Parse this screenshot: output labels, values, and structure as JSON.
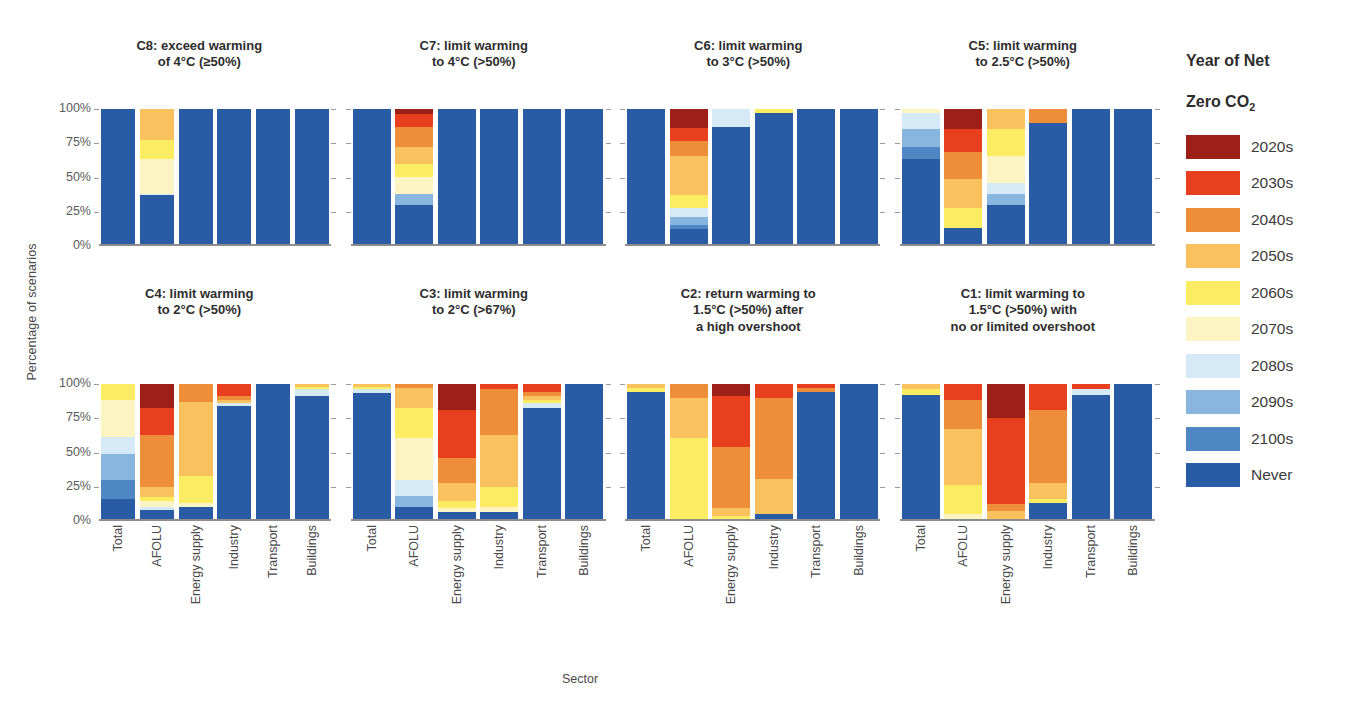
{
  "figure": {
    "ylabel": "Percentage of scenarios",
    "xlabel": "Sector"
  },
  "legend": {
    "title_line1": "Year of Net",
    "title_line2_pre": "Zero CO",
    "title_line2_sub": "2",
    "position": "right",
    "items": [
      {
        "label": "2020s",
        "color": "#9c1f18"
      },
      {
        "label": "2030s",
        "color": "#e8401f"
      },
      {
        "label": "2040s",
        "color": "#ef8e38"
      },
      {
        "label": "2050s",
        "color": "#fac25f"
      },
      {
        "label": "2060s",
        "color": "#fcec62"
      },
      {
        "label": "2070s",
        "color": "#fdf4c4"
      },
      {
        "label": "2080s",
        "color": "#d5eaf6"
      },
      {
        "label": "2090s",
        "color": "#89b6de"
      },
      {
        "label": "2100s",
        "color": "#4f87c4"
      },
      {
        "label": "Never",
        "color": "#2a5ca5"
      }
    ]
  },
  "axes": {
    "yticks": [
      "100%",
      "75%",
      "50%",
      "25%",
      "0%"
    ],
    "ytick_values": [
      100,
      75,
      50,
      25,
      0
    ],
    "ylim": [
      0,
      100
    ],
    "categories": [
      "Total",
      "AFOLU",
      "Energy supply",
      "Industry",
      "Transport",
      "Buildings"
    ]
  },
  "chart_data": {
    "type": "bar",
    "subtype": "stacked-percentage",
    "xlabel": "Sector",
    "ylabel": "Percentage of scenarios",
    "ylim": [
      0,
      100
    ],
    "grid": true,
    "legend_position": "right",
    "categories": [
      "Total",
      "AFOLU",
      "Energy supply",
      "Industry",
      "Transport",
      "Buildings"
    ],
    "series_order": [
      "2020s",
      "2030s",
      "2040s",
      "2050s",
      "2060s",
      "2070s",
      "2080s",
      "2090s",
      "2100s",
      "Never"
    ],
    "panels": [
      {
        "id": "C8",
        "title": "C8: exceed warming\nof 4°C (≥50%)",
        "row": 0,
        "bars": {
          "Total": {
            "2020s": 0,
            "2030s": 0,
            "2040s": 0,
            "2050s": 0,
            "2060s": 0,
            "2070s": 0,
            "2080s": 0,
            "2090s": 0,
            "2100s": 0,
            "Never": 100
          },
          "AFOLU": {
            "2020s": 0,
            "2030s": 0,
            "2040s": 0,
            "2050s": 23,
            "2060s": 14,
            "2070s": 26,
            "2080s": 1,
            "2090s": 0,
            "2100s": 0,
            "Never": 36
          },
          "Energy supply": {
            "2020s": 0,
            "2030s": 0,
            "2040s": 0,
            "2050s": 0,
            "2060s": 0,
            "2070s": 0,
            "2080s": 0,
            "2090s": 0,
            "2100s": 0,
            "Never": 100
          },
          "Industry": {
            "2020s": 0,
            "2030s": 0,
            "2040s": 0,
            "2050s": 0,
            "2060s": 0,
            "2070s": 0,
            "2080s": 0,
            "2090s": 0,
            "2100s": 0,
            "Never": 100
          },
          "Transport": {
            "2020s": 0,
            "2030s": 0,
            "2040s": 0,
            "2050s": 0,
            "2060s": 0,
            "2070s": 0,
            "2080s": 0,
            "2090s": 0,
            "2100s": 0,
            "Never": 100
          },
          "Buildings": {
            "2020s": 0,
            "2030s": 0,
            "2040s": 0,
            "2050s": 0,
            "2060s": 0,
            "2070s": 0,
            "2080s": 0,
            "2090s": 0,
            "2100s": 0,
            "Never": 100
          }
        }
      },
      {
        "id": "C7",
        "title": "C7: limit warming\nto 4°C (>50%)",
        "row": 0,
        "bars": {
          "Total": {
            "2020s": 0,
            "2030s": 0,
            "2040s": 0,
            "2050s": 0,
            "2060s": 0,
            "2070s": 0,
            "2080s": 0,
            "2090s": 0,
            "2100s": 0,
            "Never": 100
          },
          "AFOLU": {
            "2020s": 4,
            "2030s": 9,
            "2040s": 15,
            "2050s": 13,
            "2060s": 9,
            "2070s": 13,
            "2080s": 0,
            "2090s": 8,
            "2100s": 0,
            "Never": 29
          },
          "Energy supply": {
            "2020s": 0,
            "2030s": 0,
            "2040s": 0,
            "2050s": 0,
            "2060s": 0,
            "2070s": 0,
            "2080s": 0,
            "2090s": 0,
            "2100s": 0,
            "Never": 100
          },
          "Industry": {
            "2020s": 0,
            "2030s": 0,
            "2040s": 0,
            "2050s": 0,
            "2060s": 0,
            "2070s": 0,
            "2080s": 0,
            "2090s": 0,
            "2100s": 0,
            "Never": 100
          },
          "Transport": {
            "2020s": 0,
            "2030s": 0,
            "2040s": 0,
            "2050s": 0,
            "2060s": 0,
            "2070s": 0,
            "2080s": 0,
            "2090s": 0,
            "2100s": 0,
            "Never": 100
          },
          "Buildings": {
            "2020s": 0,
            "2030s": 0,
            "2040s": 0,
            "2050s": 0,
            "2060s": 0,
            "2070s": 0,
            "2080s": 0,
            "2090s": 0,
            "2100s": 0,
            "Never": 100
          }
        }
      },
      {
        "id": "C6",
        "title": "C6: limit warming\nto 3°C (>50%)",
        "row": 0,
        "bars": {
          "Total": {
            "2020s": 0,
            "2030s": 0,
            "2040s": 0,
            "2050s": 0,
            "2060s": 0,
            "2070s": 0,
            "2080s": 0,
            "2090s": 0,
            "2100s": 0,
            "Never": 100
          },
          "AFOLU": {
            "2020s": 14,
            "2030s": 10,
            "2040s": 11,
            "2050s": 29,
            "2060s": 9,
            "2070s": 0,
            "2080s": 7,
            "2090s": 6,
            "2100s": 3,
            "Never": 11
          },
          "Energy supply": {
            "2020s": 0,
            "2030s": 0,
            "2040s": 0,
            "2050s": 0,
            "2060s": 0,
            "2070s": 0,
            "2080s": 13,
            "2090s": 0,
            "2100s": 0,
            "Never": 87
          },
          "Industry": {
            "2020s": 0,
            "2030s": 0,
            "2040s": 0,
            "2050s": 0,
            "2060s": 3,
            "2070s": 0,
            "2080s": 0,
            "2090s": 0,
            "2100s": 0,
            "Never": 97
          },
          "Transport": {
            "2020s": 0,
            "2030s": 0,
            "2040s": 0,
            "2050s": 0,
            "2060s": 0,
            "2070s": 0,
            "2080s": 0,
            "2090s": 0,
            "2100s": 0,
            "Never": 100
          },
          "Buildings": {
            "2020s": 0,
            "2030s": 0,
            "2040s": 0,
            "2050s": 0,
            "2060s": 0,
            "2070s": 0,
            "2080s": 0,
            "2090s": 0,
            "2100s": 0,
            "Never": 100
          }
        }
      },
      {
        "id": "C5",
        "title": "C5: limit warming\nto 2.5°C (>50%)",
        "row": 0,
        "bars": {
          "Total": {
            "2020s": 0,
            "2030s": 0,
            "2040s": 0,
            "2050s": 0,
            "2060s": 0,
            "2070s": 3,
            "2080s": 12,
            "2090s": 13,
            "2100s": 9,
            "Never": 63
          },
          "AFOLU": {
            "2020s": 15,
            "2030s": 17,
            "2040s": 20,
            "2050s": 21,
            "2060s": 15,
            "2070s": 0,
            "2080s": 0,
            "2090s": 0,
            "2100s": 0,
            "Never": 12
          },
          "Energy supply": {
            "2020s": 0,
            "2030s": 0,
            "2040s": 0,
            "2050s": 15,
            "2060s": 20,
            "2070s": 20,
            "2080s": 8,
            "2090s": 8,
            "2100s": 0,
            "Never": 29
          },
          "Industry": {
            "2020s": 0,
            "2030s": 0,
            "2040s": 10,
            "2050s": 0,
            "2060s": 0,
            "2070s": 0,
            "2080s": 0,
            "2090s": 0,
            "2100s": 0,
            "Never": 90
          },
          "Transport": {
            "2020s": 0,
            "2030s": 0,
            "2040s": 0,
            "2050s": 0,
            "2060s": 0,
            "2070s": 0,
            "2080s": 0,
            "2090s": 0,
            "2100s": 0,
            "Never": 100
          },
          "Buildings": {
            "2020s": 0,
            "2030s": 0,
            "2040s": 0,
            "2050s": 0,
            "2060s": 0,
            "2070s": 0,
            "2080s": 0,
            "2090s": 0,
            "2100s": 0,
            "Never": 100
          }
        }
      },
      {
        "id": "C4",
        "title": "C4: limit warming\nto 2°C (>50%)",
        "row": 1,
        "bars": {
          "Total": {
            "2020s": 0,
            "2030s": 0,
            "2040s": 0,
            "2050s": 0,
            "2060s": 12,
            "2070s": 27,
            "2080s": 13,
            "2090s": 19,
            "2100s": 14,
            "Never": 15
          },
          "AFOLU": {
            "2020s": 18,
            "2030s": 20,
            "2040s": 38,
            "2050s": 8,
            "2060s": 3,
            "2070s": 4,
            "2080s": 2,
            "2090s": 0,
            "2100s": 0,
            "Never": 7
          },
          "Energy supply": {
            "2020s": 0,
            "2030s": 0,
            "2040s": 13,
            "2050s": 55,
            "2060s": 20,
            "2070s": 3,
            "2080s": 0,
            "2090s": 0,
            "2100s": 0,
            "Never": 9
          },
          "Industry": {
            "2020s": 0,
            "2030s": 9,
            "2040s": 3,
            "2050s": 2,
            "2060s": 0,
            "2070s": 0,
            "2080s": 2,
            "2090s": 0,
            "2100s": 0,
            "Never": 84
          },
          "Transport": {
            "2020s": 0,
            "2030s": 0,
            "2040s": 0,
            "2050s": 0,
            "2060s": 0,
            "2070s": 0,
            "2080s": 0,
            "2090s": 0,
            "2100s": 0,
            "Never": 100
          },
          "Buildings": {
            "2020s": 0,
            "2030s": 0,
            "2040s": 0,
            "2050s": 2,
            "2060s": 2,
            "2070s": 0,
            "2080s": 5,
            "2090s": 0,
            "2100s": 0,
            "Never": 91
          }
        }
      },
      {
        "id": "C3",
        "title": "C3: limit warming\nto 2°C (>67%)",
        "row": 1,
        "bars": {
          "Total": {
            "2020s": 0,
            "2030s": 0,
            "2040s": 0,
            "2050s": 2,
            "2060s": 2,
            "2070s": 0,
            "2080s": 3,
            "2090s": 0,
            "2100s": 0,
            "Never": 93
          },
          "AFOLU": {
            "2020s": 0,
            "2030s": 0,
            "2040s": 3,
            "2050s": 15,
            "2060s": 22,
            "2070s": 31,
            "2080s": 12,
            "2090s": 8,
            "2100s": 0,
            "Never": 9
          },
          "Energy supply": {
            "2020s": 19,
            "2030s": 36,
            "2040s": 18,
            "2050s": 14,
            "2060s": 5,
            "2070s": 3,
            "2080s": 0,
            "2090s": 0,
            "2100s": 0,
            "Never": 5
          },
          "Industry": {
            "2020s": 0,
            "2030s": 4,
            "2040s": 34,
            "2050s": 38,
            "2060s": 15,
            "2070s": 4,
            "2080s": 0,
            "2090s": 0,
            "2100s": 0,
            "Never": 5
          },
          "Transport": {
            "2020s": 0,
            "2030s": 6,
            "2040s": 3,
            "2050s": 3,
            "2060s": 2,
            "2070s": 0,
            "2080s": 4,
            "2090s": 0,
            "2100s": 0,
            "Never": 82
          },
          "Buildings": {
            "2020s": 0,
            "2030s": 0,
            "2040s": 0,
            "2050s": 0,
            "2060s": 0,
            "2070s": 0,
            "2080s": 0,
            "2090s": 0,
            "2100s": 0,
            "Never": 100
          }
        }
      },
      {
        "id": "C2",
        "title": "C2: return warming to\n1.5°C (>50%) after\na high overshoot",
        "row": 1,
        "bars": {
          "Total": {
            "2020s": 0,
            "2030s": 0,
            "2040s": 0,
            "2050s": 3,
            "2060s": 3,
            "2070s": 0,
            "2080s": 0,
            "2090s": 0,
            "2100s": 0,
            "Never": 94
          },
          "AFOLU": {
            "2020s": 0,
            "2030s": 0,
            "2040s": 10,
            "2050s": 30,
            "2060s": 60,
            "2070s": 0,
            "2080s": 0,
            "2090s": 0,
            "2100s": 0,
            "Never": 0
          },
          "Energy supply": {
            "2020s": 9,
            "2030s": 38,
            "2040s": 45,
            "2050s": 6,
            "2060s": 2,
            "2070s": 0,
            "2080s": 0,
            "2090s": 0,
            "2100s": 0,
            "Never": 0
          },
          "Industry": {
            "2020s": 0,
            "2030s": 10,
            "2040s": 60,
            "2050s": 26,
            "2060s": 0,
            "2070s": 0,
            "2080s": 0,
            "2090s": 0,
            "2100s": 0,
            "Never": 4
          },
          "Transport": {
            "2020s": 0,
            "2030s": 3,
            "2040s": 3,
            "2050s": 0,
            "2060s": 0,
            "2070s": 0,
            "2080s": 0,
            "2090s": 0,
            "2100s": 0,
            "Never": 94
          },
          "Buildings": {
            "2020s": 0,
            "2030s": 0,
            "2040s": 0,
            "2050s": 0,
            "2060s": 0,
            "2070s": 0,
            "2080s": 0,
            "2090s": 0,
            "2100s": 0,
            "Never": 100
          }
        }
      },
      {
        "id": "C1",
        "title": "C1: limit warming to\n1.5°C (>50%) with\nno or limited overshoot",
        "row": 1,
        "bars": {
          "Total": {
            "2020s": 0,
            "2030s": 0,
            "2040s": 0,
            "2050s": 4,
            "2060s": 4,
            "2070s": 0,
            "2080s": 0,
            "2090s": 0,
            "2100s": 0,
            "Never": 92
          },
          "AFOLU": {
            "2020s": 0,
            "2030s": 12,
            "2040s": 21,
            "2050s": 42,
            "2060s": 21,
            "2070s": 4,
            "2080s": 0,
            "2090s": 0,
            "2100s": 0,
            "Never": 0
          },
          "Energy supply": {
            "2020s": 25,
            "2030s": 64,
            "2040s": 5,
            "2050s": 6,
            "2060s": 0,
            "2070s": 0,
            "2080s": 0,
            "2090s": 0,
            "2100s": 0,
            "Never": 0
          },
          "Industry": {
            "2020s": 0,
            "2030s": 19,
            "2040s": 54,
            "2050s": 12,
            "2060s": 3,
            "2070s": 0,
            "2080s": 0,
            "2090s": 0,
            "2100s": 0,
            "Never": 12
          },
          "Transport": {
            "2020s": 0,
            "2030s": 4,
            "2040s": 0,
            "2050s": 0,
            "2060s": 0,
            "2070s": 0,
            "2080s": 4,
            "2090s": 0,
            "2100s": 0,
            "Never": 92
          },
          "Buildings": {
            "2020s": 0,
            "2030s": 0,
            "2040s": 0,
            "2050s": 0,
            "2060s": 0,
            "2070s": 0,
            "2080s": 0,
            "2090s": 0,
            "2100s": 0,
            "Never": 100
          }
        }
      },
      {
        "id": "C1b",
        "title": "",
        "row": 1,
        "hidden": true,
        "bars": {}
      }
    ]
  }
}
